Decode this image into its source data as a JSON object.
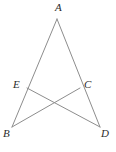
{
  "figure": {
    "type": "geometry-diagram",
    "background_color": "#ffffff",
    "stroke_color": "#8d8d8d",
    "label_color": "#2b2b2b",
    "stroke_width": 1,
    "canvas": {
      "width": 116,
      "height": 152
    },
    "points": [
      {
        "id": "A",
        "label": "A",
        "x": 57,
        "y": 19,
        "label_x": 55,
        "label_y": 2
      },
      {
        "id": "E",
        "label": "E",
        "x": 27,
        "y": 88,
        "label_x": 13,
        "label_y": 79
      },
      {
        "id": "C",
        "label": "C",
        "x": 80,
        "y": 88,
        "label_x": 84,
        "label_y": 79
      },
      {
        "id": "B",
        "label": "B",
        "x": 12,
        "y": 127,
        "label_x": 3,
        "label_y": 128
      },
      {
        "id": "D",
        "label": "D",
        "x": 100,
        "y": 127,
        "label_x": 101,
        "label_y": 128
      },
      {
        "id": "X",
        "label": "",
        "x": 56,
        "y": 106,
        "label_x": 0,
        "label_y": 0
      }
    ],
    "segments": [
      {
        "id": "AB",
        "from": "A",
        "to": "B"
      },
      {
        "id": "AD",
        "from": "A",
        "to": "D"
      },
      {
        "id": "ED",
        "from": "E",
        "to": "D"
      },
      {
        "id": "CB",
        "from": "C",
        "to": "B"
      }
    ],
    "label_texts": {
      "A": "A",
      "E": "E",
      "C": "C",
      "B": "B",
      "D": "D"
    }
  }
}
